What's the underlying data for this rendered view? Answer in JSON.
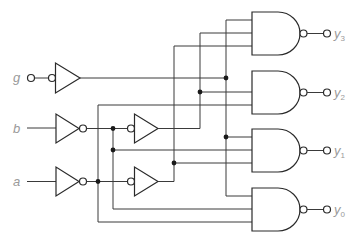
{
  "diagram": {
    "type": "logic-circuit",
    "inputs": [
      {
        "name": "g",
        "label": "g",
        "active_low": true
      },
      {
        "name": "b",
        "label": "b"
      },
      {
        "name": "a",
        "label": "a"
      }
    ],
    "outputs": [
      {
        "name": "y3",
        "label": "y",
        "subscript": "3"
      },
      {
        "name": "y2",
        "label": "y",
        "subscript": "2"
      },
      {
        "name": "y1",
        "label": "y",
        "subscript": "1"
      },
      {
        "name": "y0",
        "label": "y",
        "subscript": "0"
      }
    ],
    "gates": [
      {
        "id": "buf-g",
        "type": "buffer",
        "inverted_input": true
      },
      {
        "id": "not-b",
        "type": "not"
      },
      {
        "id": "not-a",
        "type": "not"
      },
      {
        "id": "buf-b",
        "type": "buffer",
        "inverted_input": true
      },
      {
        "id": "buf-a",
        "type": "buffer",
        "inverted_input": true
      },
      {
        "id": "nand-y3",
        "type": "nand",
        "inputs": 3
      },
      {
        "id": "nand-y2",
        "type": "nand",
        "inputs": 3
      },
      {
        "id": "nand-y1",
        "type": "nand",
        "inputs": 3
      },
      {
        "id": "nand-y0",
        "type": "nand",
        "inputs": 3
      }
    ],
    "colors": {
      "line": "#3a3a3a",
      "label": "#9a9a9a",
      "junction": "#1a1a1a"
    }
  }
}
